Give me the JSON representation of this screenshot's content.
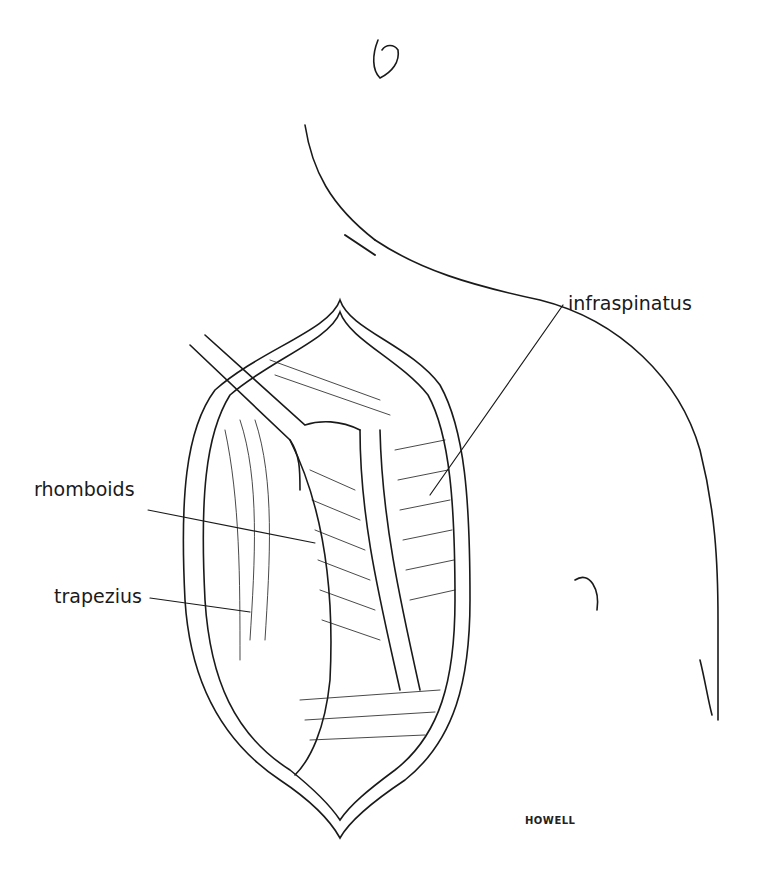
{
  "figure": {
    "labels": {
      "infraspinatus": "infraspinatus",
      "rhomboids": "rhomboids",
      "trapezius": "trapezius"
    },
    "signature": "HOWELL"
  }
}
